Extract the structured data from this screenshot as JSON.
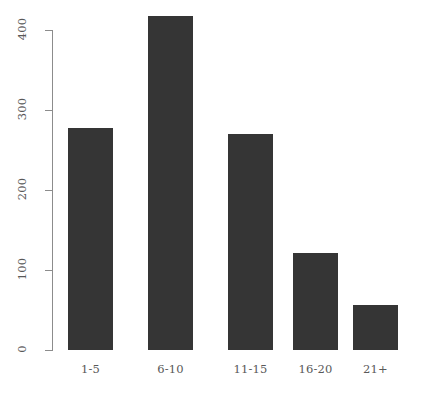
{
  "chart_data": {
    "type": "bar",
    "title": "",
    "subtitle": "",
    "xlabel": "",
    "ylabel": "",
    "categories": [
      "1-5",
      "6-10",
      "11-15",
      "16-20",
      "21+"
    ],
    "values": [
      277,
      418,
      270,
      121,
      56
    ],
    "series": [
      {
        "name": "count",
        "values": [
          277,
          418,
          270,
          121,
          56
        ]
      }
    ],
    "ylim": [
      0,
      400
    ],
    "xlim": [
      0,
      5
    ],
    "yticks": [
      0,
      100,
      200,
      300,
      400
    ],
    "ytick_labels": [
      "0",
      "100",
      "200",
      "300",
      "400"
    ],
    "xtick_labels": [
      "1-5",
      "6-10",
      "11-15",
      "16-20",
      "21+"
    ],
    "grid": false,
    "legend": false,
    "legend_position": "none",
    "bar_color": "#353535",
    "axis_color": "#8c8c8c",
    "text_color": "#595959",
    "background_color": "#ffffff",
    "ytick_label_rotation": 90,
    "annotations": []
  },
  "geometry": {
    "axis_x": 52,
    "y_zero_px": 350,
    "y_top_px": 30,
    "px_per_unit": 0.8,
    "bar_width_px": 45,
    "bar_lefts": [
      68,
      148,
      228,
      293,
      353
    ]
  }
}
